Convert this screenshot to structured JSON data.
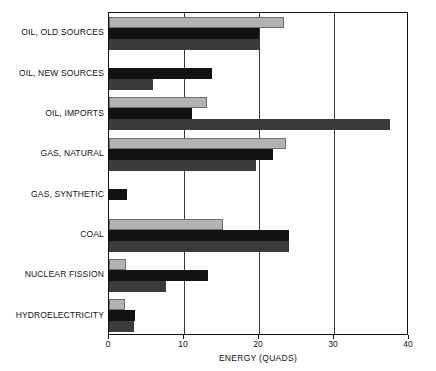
{
  "chart_data": {
    "type": "bar",
    "orientation": "horizontal",
    "title": "",
    "xlabel": "ENERGY (QUADS)",
    "ylabel": "",
    "xlim": [
      0,
      40
    ],
    "xticks": [
      0,
      10,
      20,
      30,
      40
    ],
    "xtick_labels": [
      "0",
      "10",
      "20",
      "30",
      "40"
    ],
    "grid": true,
    "grid_axis": "x",
    "legend": "none",
    "categories": [
      "OIL, OLD SOURCES",
      "OIL, NEW SOURCES",
      "OIL, IMPORTS",
      "GAS, NATURAL",
      "GAS, SYNTHETIC",
      "COAL",
      "NUCLEAR FISSION",
      "HYDROELECTRICITY"
    ],
    "series": [
      {
        "name": "series-1",
        "color": "#b2b2b2",
        "values": [
          23.3,
          0,
          13.0,
          23.6,
          0,
          15.2,
          2.3,
          2.1
        ]
      },
      {
        "name": "series-2",
        "color": "#121212",
        "values": [
          20.0,
          13.7,
          11.0,
          21.9,
          2.4,
          24.0,
          13.2,
          3.5
        ]
      },
      {
        "name": "series-3",
        "color": "#3b3b3b",
        "values": [
          20.0,
          5.9,
          37.5,
          19.6,
          0,
          24.0,
          7.6,
          3.3
        ]
      }
    ]
  }
}
